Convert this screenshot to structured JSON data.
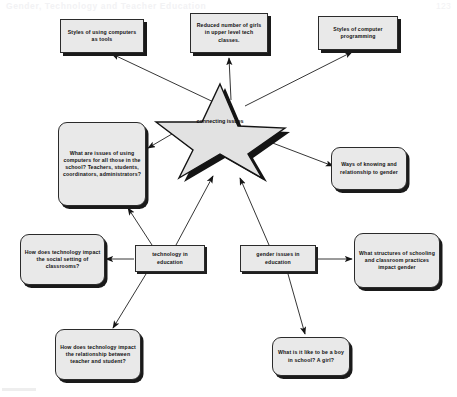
{
  "header": {
    "title": "Gender, Technology and Teacher Education",
    "page_number": "123"
  },
  "diagram": {
    "center_label": "connecting issues",
    "nodes": [
      {
        "id": "styles-tools",
        "label": "Styles of using computers as tools"
      },
      {
        "id": "reduced-girls",
        "label": "Reduced number of girls in upper level tech classes."
      },
      {
        "id": "styles-programming",
        "label": "Styles of computer programming"
      },
      {
        "id": "issues-all",
        "label": "What are issues of using computers for all those in the school? Teachers, students, coordinators, administrators?"
      },
      {
        "id": "ways-of-knowing",
        "label": "Ways of knowing and relationship to gender"
      },
      {
        "id": "social-setting",
        "label": "How does technology impact the social setting of classrooms?"
      },
      {
        "id": "technology-in-education",
        "label": "technology in education"
      },
      {
        "id": "gender-issues-in-education",
        "label": "gender issues in education"
      },
      {
        "id": "structures-schooling",
        "label": "What structures of schooling and classroom practices impact gender"
      },
      {
        "id": "teacher-student",
        "label": "How does technology impact the relationship between teacher and student?"
      },
      {
        "id": "boy-girl-school",
        "label": "What is it like to be a boy in school?  A girl?"
      }
    ]
  },
  "colors": {
    "node_fill": "#e9e9e9",
    "node_border": "#2b2b2b",
    "shadow": "#1a1a1a",
    "star_fill": "#e2e2e2",
    "line": "#1f1f1f"
  }
}
